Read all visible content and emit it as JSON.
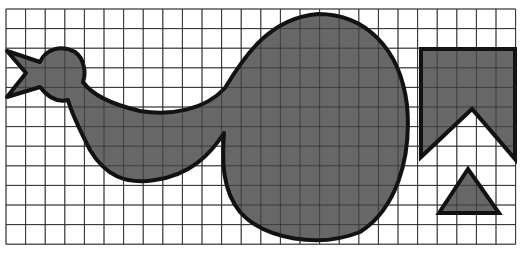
{
  "figure": {
    "colors": {
      "background": "#ffffff",
      "grid": "#3a3a3a",
      "fill": "#5a5a5a",
      "outline": "#111111"
    },
    "grid": {
      "x0": 6,
      "y0": 9,
      "cell": 19.6,
      "cols": 26,
      "rows": 12
    },
    "shapes": [
      {
        "name": "bird-figure",
        "type": "curved-shape"
      },
      {
        "name": "notched-pentagon",
        "type": "polygon"
      },
      {
        "name": "triangle",
        "type": "polygon"
      }
    ]
  }
}
